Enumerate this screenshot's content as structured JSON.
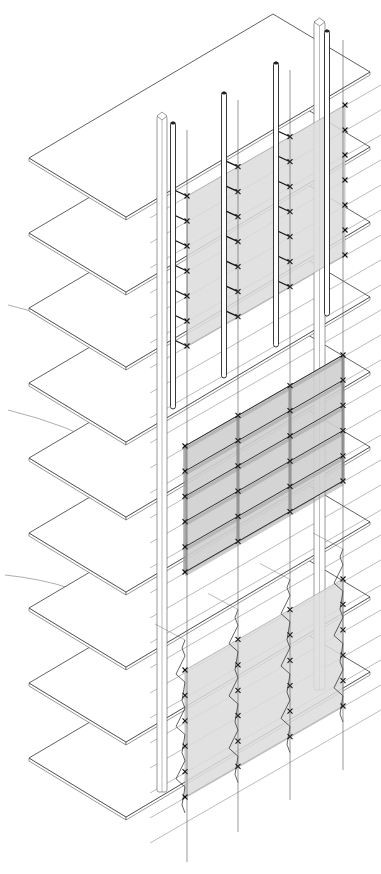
{
  "figure": {
    "type": "axonometric facade system drawing",
    "width": 381,
    "height": 874,
    "colors": {
      "background": "#ffffff",
      "line": "#3a3a3a",
      "panel_glass": "#dcdcdc",
      "panel_mid": "#cfcfcf"
    }
  },
  "slabs": {
    "count": 9,
    "left_x": 29,
    "left_y0": 158,
    "front_x": 126,
    "front_dy": 59,
    "back_x": 273,
    "back_dy": -144,
    "right_x": 370,
    "right_dy": -86,
    "spacing": 75,
    "thickness": 3
  },
  "hollow_columns": [
    {
      "x": 157,
      "w": 10,
      "top": 116,
      "bottom": 792
    },
    {
      "x": 314,
      "w": 11,
      "top": 22,
      "bottom": 690
    }
  ],
  "tube_rods": [
    {
      "x": 173,
      "top": 122,
      "bottom": 409
    },
    {
      "x": 224,
      "top": 92,
      "bottom": 378
    },
    {
      "x": 276,
      "top": 62,
      "bottom": 347
    },
    {
      "x": 327,
      "top": 30,
      "bottom": 316
    }
  ],
  "cable_lines": [
    {
      "x": 187,
      "top": 130,
      "bottom": 862
    },
    {
      "x": 238,
      "top": 100,
      "bottom": 832
    },
    {
      "x": 290,
      "top": 70,
      "bottom": 800
    },
    {
      "x": 343,
      "top": 40,
      "bottom": 770
    }
  ],
  "panels": [
    {
      "name": "upper-panel-point-supported",
      "style": "light",
      "x_left": 187,
      "x_right": 345,
      "y_top_left": 196,
      "y_bottom_left": 346,
      "slope": -0.576,
      "rows": 7,
      "mullions": [
        187,
        238,
        290,
        345
      ],
      "bracket_type": "arm"
    },
    {
      "name": "middle-panel-mullion-framed",
      "style": "mid",
      "x_left": 185,
      "x_right": 343,
      "y_top_left": 446,
      "y_bottom_left": 572,
      "slope": -0.576,
      "rows": 6,
      "mullions": [
        185,
        238,
        290,
        343
      ],
      "bracket_type": "frame"
    },
    {
      "name": "lower-panel-cable-truss",
      "style": "light",
      "x_left": 185,
      "x_right": 343,
      "y_top_left": 670,
      "y_bottom_left": 797,
      "slope": -0.576,
      "rows": 6,
      "mullions": [
        185,
        238,
        290,
        343
      ],
      "bracket_type": "truss"
    }
  ],
  "arcs": [
    {
      "d": "M 8 305 Q 110 335 172 300"
    },
    {
      "d": "M 8 410 Q 130 440 180 510"
    },
    {
      "d": "M 5 575 Q 150 590 182 700"
    }
  ],
  "guide_lines": {
    "slope": -0.576,
    "x_start": 150,
    "x_end": 381,
    "y_start_first": 218,
    "y_spacing": 25,
    "count": 26
  }
}
